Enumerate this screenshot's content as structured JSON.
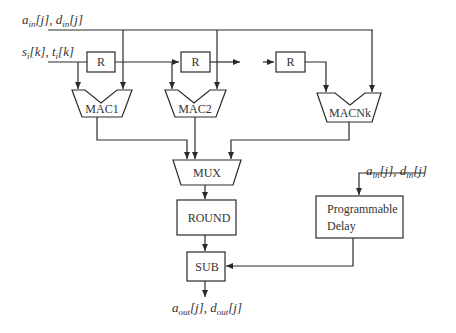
{
  "diagram": {
    "inputs": {
      "a_d_in": {
        "base1": "a",
        "sub1": "in",
        "idx1": "[j]",
        "sep": ", ",
        "base2": "d",
        "sub2": "in",
        "idx2": "[j]"
      },
      "s_t": {
        "base1": "s",
        "sub1": "i",
        "idx1": "[k]",
        "sep": ", ",
        "base2": "t",
        "sub2": "i",
        "idx2": "[k]"
      }
    },
    "registers": [
      "R",
      "R",
      "R"
    ],
    "macs": [
      "MAC1",
      "MAC2",
      "MACNk"
    ],
    "mux": "MUX",
    "round": "ROUND",
    "sub": "SUB",
    "delay": {
      "line1": "Programmable",
      "line2": "Delay"
    },
    "delay_input": {
      "base1": "a",
      "sub1": "in",
      "idx1": "[j]",
      "sep": ", ",
      "base2": "d",
      "sub2": "in",
      "idx2": "[j]"
    },
    "output": {
      "base1": "a",
      "sub1": "out",
      "idx1": "[j]",
      "sep": ", ",
      "base2": "d",
      "sub2": "out",
      "idx2": "[j]"
    }
  }
}
